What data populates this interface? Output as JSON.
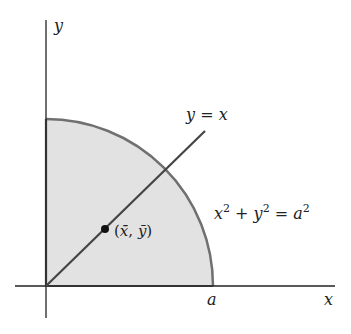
{
  "diagram": {
    "axes": {
      "x_label": "x",
      "y_label": "y"
    },
    "region": {
      "fill": "#e2e2e2",
      "boundary_color": "#707070",
      "description": "quarter disk of radius a in first quadrant"
    },
    "line": {
      "label": "y = x",
      "label_parts": [
        "y",
        " = ",
        "x"
      ]
    },
    "circle_equation": {
      "label": "x² + y² = a²",
      "parts": [
        "x",
        "2",
        " + ",
        "y",
        "2",
        " = ",
        "a",
        "2"
      ]
    },
    "centroid": {
      "label": "(x̄, ȳ)",
      "open": "(",
      "x": "x̄",
      "comma": ", ",
      "y": "ȳ",
      "close": ")"
    },
    "radius_tick": {
      "label": "a"
    }
  }
}
